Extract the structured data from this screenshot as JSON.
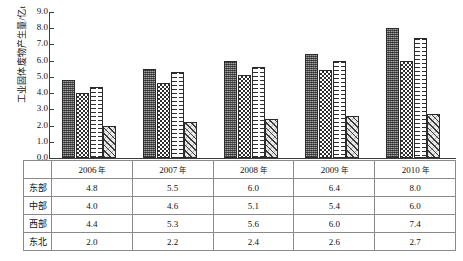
{
  "chart_data": {
    "type": "bar",
    "title": "",
    "xlabel": "",
    "ylabel": "工业固体废物产生量/亿t",
    "ylim": [
      0.0,
      9.0
    ],
    "ytick_labels": [
      "0.0",
      "1.0",
      "2.0",
      "3.0",
      "4.0",
      "5.0",
      "6.0",
      "7.0",
      "8.0",
      "9.0"
    ],
    "ytick_values": [
      0.0,
      1.0,
      2.0,
      3.0,
      4.0,
      5.0,
      6.0,
      7.0,
      8.0,
      9.0
    ],
    "grid": false,
    "legend_position": "none",
    "categories": [
      "2006 年",
      "2007 年",
      "2008 年",
      "2009 年",
      "2010 年"
    ],
    "series": [
      {
        "name": "东部",
        "pattern": "dark-dotted",
        "values": [
          4.8,
          5.5,
          6.0,
          6.4,
          8.0
        ]
      },
      {
        "name": "中部",
        "pattern": "checkerboard",
        "values": [
          4.0,
          4.6,
          5.1,
          5.4,
          6.0
        ]
      },
      {
        "name": "西部",
        "pattern": "dashed-white",
        "values": [
          4.4,
          5.3,
          5.6,
          6.0,
          7.4
        ]
      },
      {
        "name": "东北",
        "pattern": "diagonal-hatch",
        "values": [
          2.0,
          2.2,
          2.4,
          2.6,
          2.7
        ]
      }
    ]
  },
  "table": {
    "corner_label": "",
    "column_headers": [
      "2006 年",
      "2007 年",
      "2008 年",
      "2009 年",
      "2010 年"
    ],
    "column_header_numbers": [
      "2006",
      "2007",
      "2008",
      "2009",
      "2010"
    ],
    "column_header_suffix": "年",
    "rows": [
      {
        "label": "东部",
        "values": [
          "4.8",
          "5.5",
          "6.0",
          "6.4",
          "8.0"
        ]
      },
      {
        "label": "中部",
        "values": [
          "4.0",
          "4.6",
          "5.1",
          "5.4",
          "6.0"
        ]
      },
      {
        "label": "西部",
        "values": [
          "4.4",
          "5.3",
          "5.6",
          "6.0",
          "7.4"
        ]
      },
      {
        "label": "东北",
        "values": [
          "2.0",
          "2.2",
          "2.4",
          "2.6",
          "2.7"
        ]
      }
    ]
  },
  "colors": {
    "axis": "#3b3b3b",
    "grid_border": "#8a8a8a",
    "bar_east": "#6e6e6e",
    "bar_central": "#2f2f2f",
    "bar_west": "#ffffff",
    "bar_northeast": "#e8e8e8",
    "text": "#111111",
    "background": "#ffffff"
  }
}
